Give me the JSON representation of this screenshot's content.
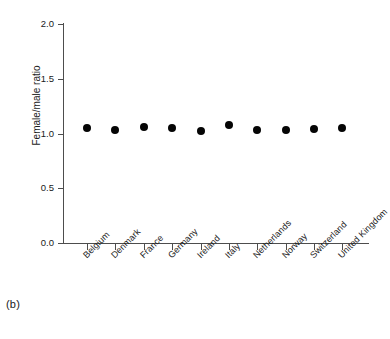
{
  "panel": {
    "label": "(b)"
  },
  "chart_data": {
    "type": "scatter",
    "title": "",
    "subtitle": "",
    "xlabel": "",
    "ylabel": "Female/male ratio",
    "ylim": [
      0.0,
      2.0
    ],
    "yticks": [
      "0.0",
      "0.5",
      "1.0",
      "1.5",
      "2.0"
    ],
    "ytick_values": [
      0.0,
      0.5,
      1.0,
      1.5,
      2.0
    ],
    "grid": false,
    "legend": null,
    "marker": "filled-circle",
    "marker_color": "#050505",
    "categories": [
      "Belgium",
      "Denmark",
      "France",
      "Germany",
      "Ireland",
      "Italy",
      "Netherlands",
      "Norway",
      "Switzerland",
      "United Kingdom"
    ],
    "values": [
      1.05,
      1.03,
      1.06,
      1.05,
      1.02,
      1.08,
      1.03,
      1.03,
      1.04,
      1.05
    ],
    "series": [
      {
        "name": "Female/male ratio",
        "values": [
          1.05,
          1.03,
          1.06,
          1.05,
          1.02,
          1.08,
          1.03,
          1.03,
          1.04,
          1.05
        ]
      }
    ]
  },
  "colors": {
    "axis": "#4d4d4d",
    "marker": "#050505",
    "text": "#1a1a1a",
    "background": "#ffffff"
  }
}
